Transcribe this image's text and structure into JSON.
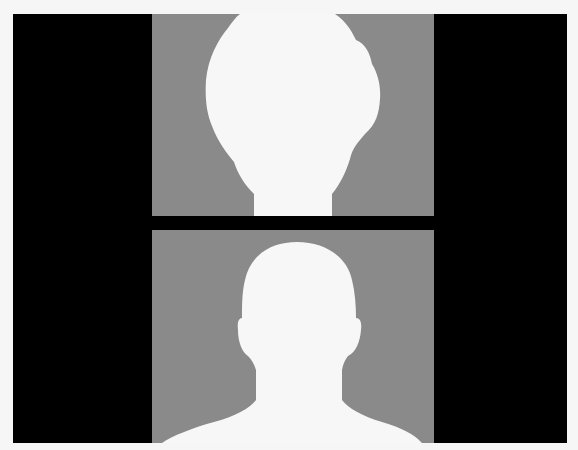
{
  "image": {
    "description": "Two grey portrait-silhouette panels stacked vertically on a black background",
    "colors": {
      "frame": "#000000",
      "panel_background": "#8a8a8a",
      "silhouette": "#f7f7f7",
      "outer_background": "#f6f6f6"
    },
    "panels": [
      {
        "position": "top",
        "subject": "head silhouette, oval/bulbous shape, front view",
        "watermark": ""
      },
      {
        "position": "bottom",
        "subject": "head and shoulders silhouette, front view"
      }
    ]
  }
}
